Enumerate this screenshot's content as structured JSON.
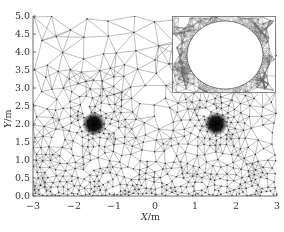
{
  "chart_data": {
    "type": "mesh",
    "title": "",
    "xlabel": "X/m",
    "ylabel": "Y/m",
    "xlim": [
      -3,
      3
    ],
    "ylim": [
      0.0,
      5.0
    ],
    "x_ticks": [
      "-3",
      "-2",
      "-1",
      "0",
      "1",
      "2",
      "3"
    ],
    "y_ticks": [
      "0.0",
      "0.5",
      "1.0",
      "1.5",
      "2.0",
      "2.5",
      "3.0",
      "3.5",
      "4.0",
      "4.5",
      "5.0"
    ],
    "grid": false,
    "legend": null,
    "refinement_centers": [
      {
        "name": "left-hole",
        "x": -1.5,
        "y": 2.0
      },
      {
        "name": "right-hole",
        "x": 1.5,
        "y": 2.0
      }
    ],
    "surface_refinement": [
      {
        "x": -1.5,
        "y": 0.0
      },
      {
        "x": 1.5,
        "y": 0.0
      }
    ],
    "inset": {
      "description": "zoomed view of circular hole with surrounding triangular mesh",
      "x_range_px": [
        172,
        276
      ],
      "y_range_px": [
        16,
        93
      ]
    }
  },
  "axes": {
    "xlabel_italic": "X",
    "xlabel_unit": "/m",
    "ylabel_italic": "Y",
    "ylabel_unit": "/m"
  },
  "colors": {
    "mesh_line": "#555555",
    "node": "#222222",
    "axis": "#444444",
    "background": "#ffffff"
  }
}
